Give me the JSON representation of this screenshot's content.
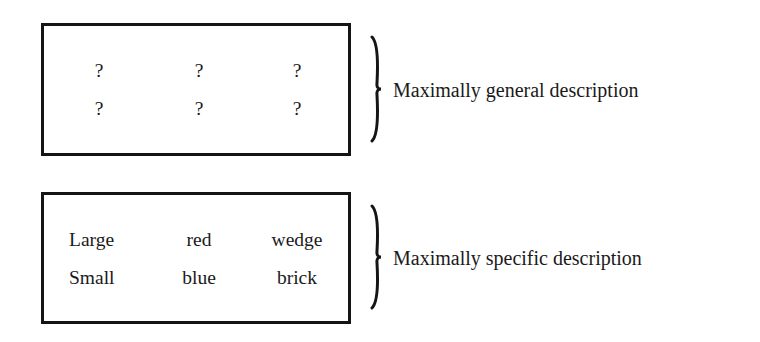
{
  "diagram": {
    "general_box": {
      "label": "Maximally general description",
      "rows": [
        [
          "?",
          "?",
          "?"
        ],
        [
          "?",
          "?",
          "?"
        ]
      ]
    },
    "specific_box": {
      "label": "Maximally specific description",
      "rows": [
        [
          "Large",
          "red",
          "wedge"
        ],
        [
          "Small",
          "blue",
          "brick"
        ]
      ]
    },
    "colors": {
      "ink": "#151515",
      "background": "#ffffff"
    }
  }
}
